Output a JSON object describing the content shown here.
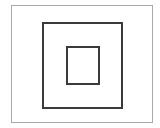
{
  "figure": {
    "background_color": "#ffffff",
    "shapes": [
      {
        "name": "outer-frame",
        "label": "Outer frame",
        "stroke_color": "#aaaaaa",
        "stroke_width_px": 1,
        "fill": "none",
        "x": 11,
        "y": 5,
        "width": 142,
        "height": 118
      },
      {
        "name": "middle-frame",
        "label": "Middle square",
        "stroke_color": "#3a3a3a",
        "stroke_width_px": 2,
        "fill": "none",
        "x": 42,
        "y": 22,
        "width": 81,
        "height": 87
      },
      {
        "name": "inner-frame",
        "label": "Inner square",
        "stroke_color": "#3a3a3a",
        "stroke_width_px": 2,
        "fill": "none",
        "x": 66,
        "y": 46,
        "width": 34,
        "height": 39
      }
    ]
  }
}
